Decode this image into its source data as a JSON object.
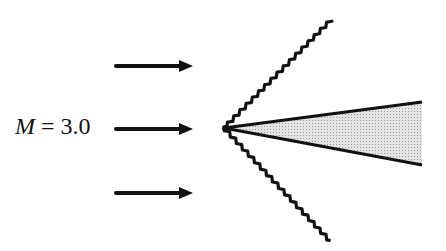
{
  "diagram": {
    "label": {
      "variable": "M",
      "equals": " = ",
      "value": "3.0"
    },
    "colors": {
      "ink": "#111111",
      "wedge_fill": "#d6d6d6",
      "background": "#ffffff"
    },
    "flow_arrows": [
      {
        "x1": 116,
        "x2": 193,
        "y": 66
      },
      {
        "x1": 116,
        "x2": 193,
        "y": 129
      },
      {
        "x1": 116,
        "x2": 193,
        "y": 193
      }
    ],
    "apex": {
      "x": 224,
      "y": 128
    },
    "shock_waves": [
      {
        "name": "upper-shock",
        "x2": 331,
        "y2": 20
      },
      {
        "name": "lower-shock",
        "x2": 330,
        "y2": 241
      }
    ],
    "wedge": {
      "top_end": {
        "x": 422,
        "y": 102
      },
      "bottom_end": {
        "x": 422,
        "y": 165
      }
    }
  }
}
